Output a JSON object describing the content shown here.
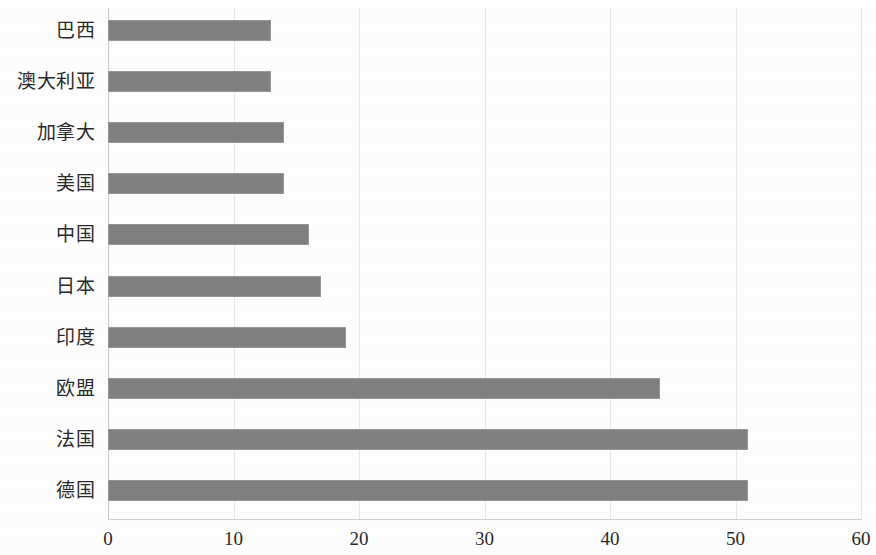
{
  "chart_data": {
    "type": "bar",
    "orientation": "horizontal",
    "title": "",
    "subtitle": "",
    "xlabel": "",
    "ylabel": "",
    "categories": [
      "巴西",
      "澳大利亚",
      "加拿大",
      "美国",
      "中国",
      "日本",
      "印度",
      "欧盟",
      "法国",
      "德国"
    ],
    "values": [
      13,
      13,
      14,
      14,
      16,
      17,
      19,
      44,
      51,
      51
    ],
    "xlim": [
      0,
      60
    ],
    "xticks": [
      0,
      10,
      20,
      30,
      40,
      50,
      60
    ],
    "xtick_labels": [
      "0",
      "10",
      "20",
      "30",
      "40",
      "50",
      "60"
    ],
    "grid": "vertical",
    "legend": "none",
    "bar_color": "#808080",
    "gridline_color": "#e6e6e6",
    "axis_color": "#cfcfcf",
    "background_color": "#fdfdfd",
    "bar_order": "top-to-bottom"
  }
}
